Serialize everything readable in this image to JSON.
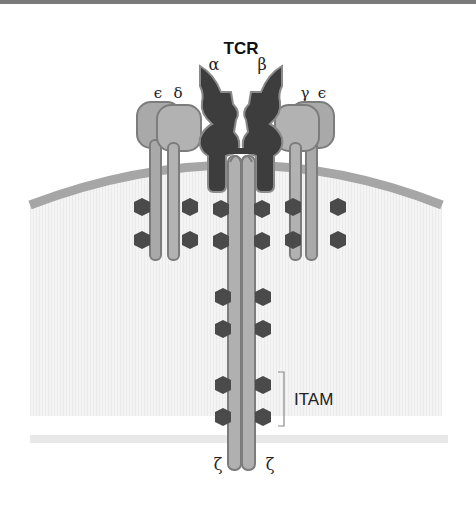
{
  "diagram": {
    "title": "TCR",
    "tcr_chains": {
      "alpha": "α",
      "beta": "β"
    },
    "cd3_left": {
      "epsilon": "ϵ",
      "delta": "δ"
    },
    "cd3_right": {
      "gamma": "γ",
      "epsilon": "ϵ"
    },
    "zeta_left": "ζ",
    "zeta_right": "ζ",
    "itam_label": "ITAM",
    "colors": {
      "tcr_dark": "#3d3d3d",
      "cd3_light": "#a9a9a9",
      "cd3_outline": "#7c7c7c",
      "itam_hexagon": "#4a4a4a",
      "membrane": "#a6a6a6",
      "cytoplasm": "#f2f2f2",
      "bracket": "#8a8a8a"
    }
  }
}
